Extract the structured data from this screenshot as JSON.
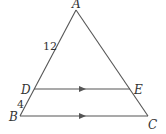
{
  "diagram": {
    "type": "triangle-with-parallel-segment",
    "points": {
      "A": {
        "label": "A",
        "x": 76,
        "y": 10
      },
      "B": {
        "label": "B",
        "x": 20,
        "y": 116
      },
      "C": {
        "label": "C",
        "x": 148,
        "y": 116
      },
      "D": {
        "label": "D",
        "x": 34,
        "y": 89
      },
      "E": {
        "label": "E",
        "x": 130,
        "y": 89
      }
    },
    "segment_labels": {
      "AD": "12",
      "DB": "4"
    },
    "parallel": [
      "DE",
      "BC"
    ],
    "colors": {
      "line": "#555555",
      "text": "#333333",
      "background": "#ffffff"
    }
  }
}
